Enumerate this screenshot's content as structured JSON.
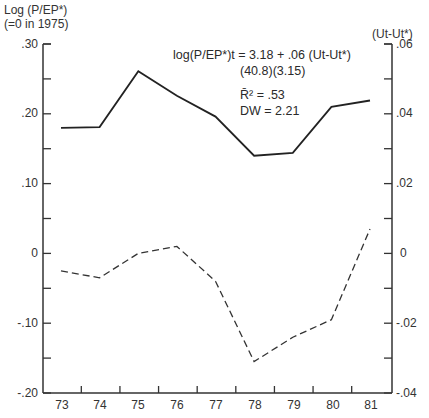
{
  "left_axis": {
    "title_line1": "Log (P/EP*)",
    "title_line2": "(=0 in 1975)",
    "ticks": [
      ".30",
      ".20",
      ".10",
      "0",
      "-.10",
      "-.20"
    ]
  },
  "right_axis": {
    "title": "(Ut-Ut*)",
    "ticks": [
      ".06",
      ".04",
      ".02",
      "0",
      "-.02",
      "-.04"
    ]
  },
  "x_axis": {
    "ticks": [
      "73",
      "74",
      "75",
      "76",
      "77",
      "78",
      "79",
      "80",
      "81"
    ]
  },
  "annotation": {
    "equation": "log(P/EP*)t = 3.18 + .06 (Ut-Ut*)",
    "t_stats": "(40.8)(3.15)",
    "r2": "R̄² = .53",
    "dw": "DW = 2.21"
  },
  "colors": {
    "line": "#222222",
    "axis": "#333333",
    "background": "#ffffff"
  },
  "chart_data": {
    "type": "line",
    "title": "",
    "x": [
      "73",
      "74",
      "75",
      "76",
      "77",
      "78",
      "79",
      "80",
      "81"
    ],
    "xlabel": "",
    "ylabel": "Log (P/EP*) (=0 in 1975)",
    "ylim": [
      -0.2,
      0.3
    ],
    "y2label": "(Ut - Ut*)",
    "y2lim": [
      -0.04,
      0.06
    ],
    "grid": false,
    "series": [
      {
        "name": "Log (P/EP*)",
        "axis": "left",
        "style": "solid",
        "values": [
          0.18,
          0.181,
          0.261,
          0.226,
          0.196,
          0.14,
          0.144,
          0.21,
          0.219
        ]
      },
      {
        "name": "(Ut - Ut*)",
        "axis": "right",
        "style": "dashed",
        "values": [
          -0.005,
          -0.007,
          0.0,
          0.002,
          -0.008,
          -0.031,
          -0.024,
          -0.019,
          0.007
        ]
      }
    ],
    "annotations": [
      "log(P/EP*)t = 3.18 + .06 (Ut-Ut*)",
      "(40.8)(3.15)",
      "R̄² = .53",
      "DW = 2.21"
    ]
  }
}
